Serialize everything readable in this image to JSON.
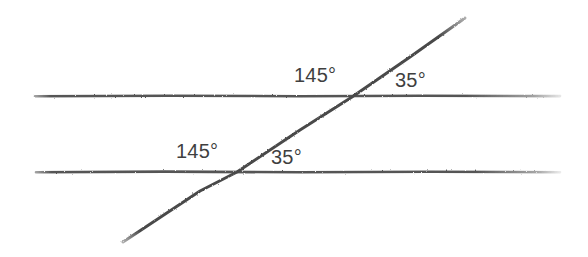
{
  "figure": {
    "background_color": "#ffffff",
    "line_color": "#555555",
    "transversal_color": "#4a4a4a",
    "label_color": "#3f3f3f",
    "labels": {
      "upper_obtuse": "145°",
      "upper_acute": "35°",
      "lower_obtuse": "145°",
      "lower_acute": "35°"
    }
  },
  "chart_data": {
    "type": "diagram",
    "xlabel": "",
    "ylabel": "",
    "xlim": [
      0,
      588
    ],
    "ylim": [
      257,
      0
    ],
    "grid": false,
    "legend": null,
    "geometry": {
      "lines": [
        {
          "name": "upper-parallel-line",
          "role": "parallel",
          "x1": 35,
          "y1": 96,
          "x2": 560,
          "y2": 96,
          "color": "#555555",
          "width": 2.6
        },
        {
          "name": "lower-parallel-line",
          "role": "parallel",
          "x1": 36,
          "y1": 172,
          "x2": 560,
          "y2": 172,
          "color": "#555555",
          "width": 2.6
        },
        {
          "name": "transversal-line",
          "role": "transversal",
          "x1": 123,
          "y1": 242,
          "x2": 465,
          "y2": 18,
          "color": "#4a4a4a",
          "width": 3.0
        }
      ],
      "intersections": [
        {
          "name": "upper-intersection",
          "x": 352,
          "y": 97
        },
        {
          "name": "lower-intersection",
          "x": 237,
          "y": 172
        }
      ]
    },
    "annotations": [
      {
        "name": "upper-obtuse-angle",
        "text": "145°",
        "x": 294,
        "y": 75,
        "at": "upper-intersection",
        "side": "left-above",
        "value": 145,
        "unit": "degrees"
      },
      {
        "name": "upper-acute-angle",
        "text": "35°",
        "x": 395,
        "y": 80,
        "at": "upper-intersection",
        "side": "right-above",
        "value": 35,
        "unit": "degrees"
      },
      {
        "name": "lower-obtuse-angle",
        "text": "145°",
        "x": 176,
        "y": 151,
        "at": "lower-intersection",
        "side": "left-above",
        "value": 145,
        "unit": "degrees"
      },
      {
        "name": "lower-acute-angle",
        "text": "35°",
        "x": 271,
        "y": 157,
        "at": "lower-intersection",
        "side": "right-above",
        "value": 35,
        "unit": "degrees"
      }
    ]
  }
}
